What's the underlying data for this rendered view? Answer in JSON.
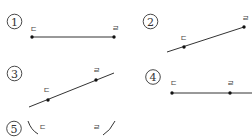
{
  "options": [
    {
      "number": "1",
      "marker": "①",
      "type": "line-segment",
      "points": [
        {
          "label": "ㄷ",
          "x": 32,
          "y": 37,
          "lx": 33,
          "ly": 32
        },
        {
          "label": "ㄹ",
          "x": 114,
          "y": 37,
          "lx": 115,
          "ly": 31
        }
      ],
      "line": {
        "x1": 32,
        "y1": 37,
        "x2": 114,
        "y2": 37
      },
      "circle": {
        "cx": 14.5,
        "cy": 21.5
      }
    },
    {
      "number": "2",
      "marker": "②",
      "type": "ray",
      "points": [
        {
          "label": "ㄷ",
          "x": 184,
          "y": 47,
          "lx": 183,
          "ly": 41
        },
        {
          "label": "ㄹ",
          "x": 244,
          "y": 27,
          "lx": 245,
          "ly": 21
        }
      ],
      "line": {
        "x1": 167,
        "y1": 52,
        "x2": 244,
        "y2": 27
      },
      "circle": {
        "cx": 150.5,
        "cy": 21.5
      }
    },
    {
      "number": "3",
      "marker": "③",
      "type": "line",
      "points": [
        {
          "label": "ㄷ",
          "x": 48,
          "y": 100,
          "lx": 46,
          "ly": 93
        },
        {
          "label": "ㄹ",
          "x": 96,
          "y": 80,
          "lx": 96,
          "ly": 73
        }
      ],
      "line": {
        "x1": 29,
        "y1": 107,
        "x2": 114,
        "y2": 73
      },
      "circle": {
        "cx": 14.5,
        "cy": 73.5
      }
    },
    {
      "number": "4",
      "marker": "④",
      "type": "ray",
      "points": [
        {
          "label": "ㄷ",
          "x": 172,
          "y": 93,
          "lx": 173,
          "ly": 86
        },
        {
          "label": "ㄹ",
          "x": 230,
          "y": 93,
          "lx": 230,
          "ly": 86
        }
      ],
      "line": {
        "x1": 172,
        "y1": 93,
        "x2": 252,
        "y2": 93
      },
      "circle": {
        "cx": 153,
        "cy": 77
      }
    },
    {
      "number": "5",
      "marker": "⑤",
      "type": "curve",
      "points": [
        {
          "label": "ㄷ",
          "x": 0,
          "y": 0,
          "lx": 42,
          "ly": 130
        },
        {
          "label": "ㄹ",
          "x": 0,
          "y": 0,
          "lx": 96,
          "ly": 130
        }
      ],
      "curves": [
        "M28 121 Q31 130 38 134",
        "M103 135 Q110 131 115 121"
      ],
      "circle": {
        "cx": 14,
        "cy": 128.5
      }
    }
  ],
  "colors": {
    "stroke": "#333333",
    "dot": "#111111",
    "background": "#ffffff"
  }
}
